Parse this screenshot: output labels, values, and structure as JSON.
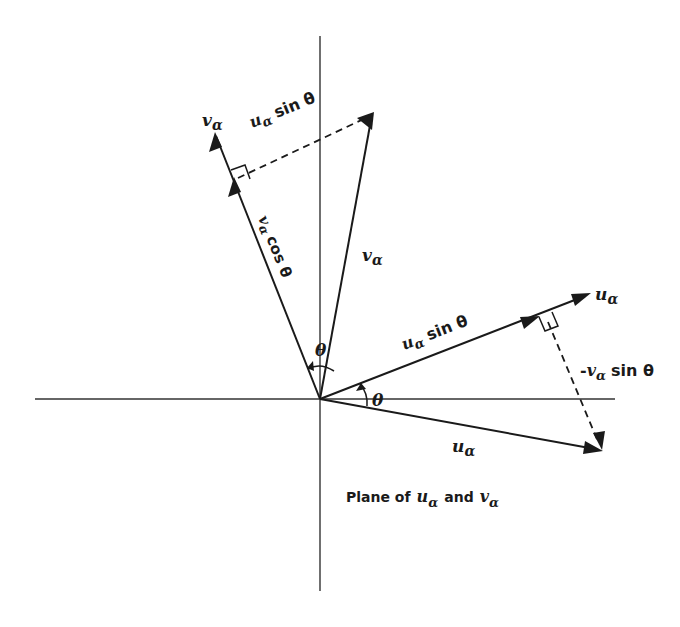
{
  "diagram": {
    "caption": {
      "prefix": "Plane of",
      "u": "u",
      "u_sub": "α",
      "and": "and",
      "v": "v",
      "v_sub": "α"
    },
    "axes": {
      "origin": [
        320,
        399
      ],
      "vertical": {
        "x": 320,
        "y1": 36,
        "y2": 591
      },
      "horizontal": {
        "y": 399,
        "x1": 35,
        "x2": 615
      }
    },
    "vectors": {
      "v_unit": {
        "label": "v",
        "sub": "α",
        "from": [
          320,
          399
        ],
        "to": [
          215,
          133
        ]
      },
      "v_big": {
        "label": "v",
        "sub": "α",
        "from": [
          320,
          399
        ],
        "to": [
          373,
          113
        ]
      },
      "u_unit": {
        "label": "u",
        "sub": "α",
        "from": [
          320,
          399
        ],
        "to": [
          590,
          294
        ]
      },
      "u_big": {
        "label": "u",
        "sub": "α",
        "from": [
          320,
          399
        ],
        "to": [
          602,
          450
        ]
      }
    },
    "projections": {
      "v_cos": {
        "label_v": "v",
        "label_sub": "α",
        "label_rest": "cos θ"
      },
      "u_sin_upper": {
        "label_u": "u",
        "label_sub": "α",
        "label_rest": "sin θ"
      },
      "u_sin_right": {
        "label_u": "u",
        "label_sub": "α",
        "label_rest": "sin θ"
      },
      "neg_v_sin": {
        "label_prefix": "-",
        "label_v": "v",
        "label_sub": "α",
        "label_rest": "sin θ"
      }
    },
    "angles": {
      "upper": {
        "label": "θ"
      },
      "lower": {
        "label": "θ"
      }
    }
  }
}
